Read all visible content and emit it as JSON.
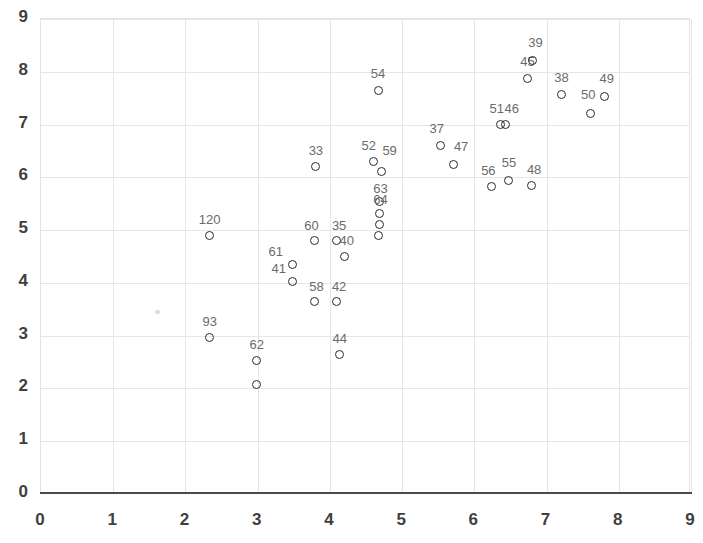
{
  "chart_data": {
    "type": "scatter",
    "title": "",
    "xlabel": "",
    "ylabel": "",
    "xlim": [
      0,
      9
    ],
    "ylim": [
      0,
      9
    ],
    "xticks": [
      0,
      1,
      2,
      3,
      4,
      5,
      6,
      7,
      8,
      9
    ],
    "yticks": [
      0,
      1,
      2,
      3,
      4,
      5,
      6,
      7,
      8,
      9
    ],
    "grid": true,
    "legend": "none",
    "marker": "open-circle",
    "marker_color": "#2b2b2b",
    "label_color": "#6b6b6b",
    "grid_color": "#e6e6e6",
    "axis_color": "#4a4a4a",
    "points": [
      {
        "label": "120",
        "x": 2.35,
        "y": 4.88,
        "label_dx": 0,
        "label_dy": -15
      },
      {
        "label": "93",
        "x": 2.35,
        "y": 2.95,
        "label_dx": 0,
        "label_dy": -15
      },
      {
        "label": "62",
        "x": 3.0,
        "y": 2.52,
        "label_dx": 0,
        "label_dy": -15
      },
      {
        "label": "",
        "x": 3.0,
        "y": 2.05,
        "label_dx": 0,
        "label_dy": -15
      },
      {
        "label": "61",
        "x": 3.5,
        "y": 4.33,
        "label_dx": -17,
        "label_dy": -12
      },
      {
        "label": "41",
        "x": 3.5,
        "y": 4.0,
        "label_dx": -14,
        "label_dy": -13
      },
      {
        "label": "60",
        "x": 3.8,
        "y": 4.78,
        "label_dx": -3,
        "label_dy": -15
      },
      {
        "label": "58",
        "x": 3.8,
        "y": 3.62,
        "label_dx": 2,
        "label_dy": -15
      },
      {
        "label": "35",
        "x": 4.1,
        "y": 4.78,
        "label_dx": 3,
        "label_dy": -15
      },
      {
        "label": "42",
        "x": 4.1,
        "y": 3.62,
        "label_dx": 3,
        "label_dy": -15
      },
      {
        "label": "40",
        "x": 4.22,
        "y": 4.48,
        "label_dx": 2,
        "label_dy": -16
      },
      {
        "label": "44",
        "x": 4.15,
        "y": 2.62,
        "label_dx": 0,
        "label_dy": -16
      },
      {
        "label": "33",
        "x": 3.82,
        "y": 6.18,
        "label_dx": 0,
        "label_dy": -16
      },
      {
        "label": "52",
        "x": 4.62,
        "y": 6.28,
        "label_dx": -5,
        "label_dy": -16
      },
      {
        "label": "59",
        "x": 4.73,
        "y": 6.1,
        "label_dx": 8,
        "label_dy": -20
      },
      {
        "label": "63",
        "x": 4.7,
        "y": 5.52,
        "label_dx": 1,
        "label_dy": -13
      },
      {
        "label": "64",
        "x": 4.7,
        "y": 5.3,
        "label_dx": 1,
        "label_dy": -13
      },
      {
        "label": "",
        "x": 4.7,
        "y": 5.08,
        "label_dx": 0,
        "label_dy": -14
      },
      {
        "label": "",
        "x": 4.68,
        "y": 4.88,
        "label_dx": 0,
        "label_dy": -14
      },
      {
        "label": "54",
        "x": 4.68,
        "y": 7.62,
        "label_dx": 0,
        "label_dy": -17
      },
      {
        "label": "37",
        "x": 5.55,
        "y": 6.58,
        "label_dx": -4,
        "label_dy": -17
      },
      {
        "label": "47",
        "x": 5.72,
        "y": 6.22,
        "label_dx": 8,
        "label_dy": -18
      },
      {
        "label": "56",
        "x": 6.25,
        "y": 5.8,
        "label_dx": -3,
        "label_dy": -16
      },
      {
        "label": "55",
        "x": 6.48,
        "y": 5.92,
        "label_dx": 1,
        "label_dy": -18
      },
      {
        "label": "48",
        "x": 6.8,
        "y": 5.82,
        "label_dx": 3,
        "label_dy": -16
      },
      {
        "label": "51",
        "x": 6.38,
        "y": 6.98,
        "label_dx": -4,
        "label_dy": -16
      },
      {
        "label": "46",
        "x": 6.45,
        "y": 6.98,
        "label_dx": 6,
        "label_dy": -16
      },
      {
        "label": "45",
        "x": 6.75,
        "y": 7.85,
        "label_dx": 0,
        "label_dy": -17
      },
      {
        "label": "39",
        "x": 6.82,
        "y": 8.2,
        "label_dx": 3,
        "label_dy": -17
      },
      {
        "label": "38",
        "x": 7.22,
        "y": 7.55,
        "label_dx": 0,
        "label_dy": -17
      },
      {
        "label": "50",
        "x": 7.62,
        "y": 7.2,
        "label_dx": -2,
        "label_dy": -18
      },
      {
        "label": "49",
        "x": 7.82,
        "y": 7.52,
        "label_dx": 2,
        "label_dy": -17
      }
    ]
  }
}
